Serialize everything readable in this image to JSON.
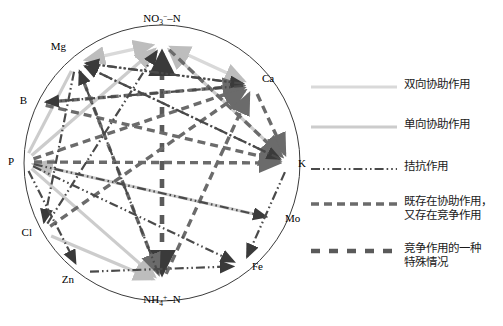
{
  "figure": {
    "type": "network-diagram",
    "title": "",
    "shape": "circle",
    "background": "#ffffff"
  },
  "nodes": [
    {
      "id": "NO3N",
      "label": "NO",
      "sup": "−",
      "sub": "3",
      "tail": "–N",
      "display": "NO3−–N",
      "x": 162,
      "y": 43,
      "lx": 162,
      "ly": 22,
      "anchor": "middle"
    },
    {
      "id": "Mg",
      "label": "Mg",
      "display": "Mg",
      "x": 76,
      "y": 62,
      "lx": 66,
      "ly": 50,
      "anchor": "end"
    },
    {
      "id": "B",
      "label": "B",
      "display": "B",
      "x": 36,
      "y": 103,
      "lx": 27,
      "ly": 104,
      "anchor": "end"
    },
    {
      "id": "P",
      "label": "P",
      "display": "P",
      "x": 24,
      "y": 162,
      "lx": 14,
      "ly": 165,
      "anchor": "end"
    },
    {
      "id": "Cl",
      "label": "Cl",
      "display": "Cl",
      "x": 42,
      "y": 232,
      "lx": 32,
      "ly": 236,
      "anchor": "end"
    },
    {
      "id": "Zn",
      "label": "Zn",
      "display": "Zn",
      "x": 80,
      "y": 272,
      "lx": 74,
      "ly": 283,
      "anchor": "end"
    },
    {
      "id": "NH4N",
      "label": "NH",
      "sup": "+",
      "sub": "4",
      "tail": "–N",
      "display": "NH4+–N",
      "x": 162,
      "y": 283,
      "lx": 162,
      "ly": 303,
      "anchor": "middle"
    },
    {
      "id": "Fe",
      "label": "Fe",
      "display": "Fe",
      "x": 243,
      "y": 266,
      "lx": 252,
      "ly": 270,
      "anchor": "start"
    },
    {
      "id": "Mo",
      "label": "Mo",
      "display": "Mo",
      "x": 276,
      "y": 219,
      "lx": 285,
      "ly": 222,
      "anchor": "start"
    },
    {
      "id": "K",
      "label": "K",
      "display": "K",
      "x": 289,
      "y": 163,
      "lx": 298,
      "ly": 167,
      "anchor": "start"
    },
    {
      "id": "Ca",
      "label": "Ca",
      "display": "Ca",
      "x": 253,
      "y": 85,
      "lx": 262,
      "ly": 82,
      "anchor": "start"
    }
  ],
  "circle": {
    "cx": 162,
    "cy": 163,
    "r": 138,
    "stroke": "#3b3b3b",
    "stroke_width": 1
  },
  "edge_styles": {
    "bidir_synergy": {
      "color": "#d9d9d9",
      "width": 3.2,
      "dash": "none"
    },
    "unidir_synergy": {
      "color": "#cccccc",
      "width": 3.2,
      "dash": "none"
    },
    "antagonism": {
      "color": "#4a4a4a",
      "width": 2.2,
      "dash": "9,3,1.6,3,1.6,3"
    },
    "both": {
      "color": "#6b6b6b",
      "width": 3.4,
      "dash": "8,5"
    },
    "special": {
      "color": "#5a5a5a",
      "width": 4.6,
      "dash": "9,9"
    }
  },
  "edges": [
    {
      "from": "Mg",
      "to": "NO3N",
      "style": "bidir_synergy",
      "arrow": "both"
    },
    {
      "from": "Ca",
      "to": "NO3N",
      "style": "bidir_synergy",
      "arrow": "both"
    },
    {
      "from": "Mg",
      "to": "P",
      "style": "unidir_synergy",
      "arrow": "none"
    },
    {
      "from": "P",
      "to": "NO3N",
      "style": "unidir_synergy",
      "arrow": "to"
    },
    {
      "from": "K",
      "to": "NO3N",
      "style": "unidir_synergy",
      "arrow": "to"
    },
    {
      "from": "Mo",
      "to": "P",
      "style": "unidir_synergy",
      "arrow": "to"
    },
    {
      "from": "Cl",
      "to": "NH4N",
      "style": "unidir_synergy",
      "arrow": "to"
    },
    {
      "from": "P",
      "to": "NH4N",
      "style": "unidir_synergy",
      "arrow": "to"
    },
    {
      "from": "NO3N",
      "to": "NH4N",
      "style": "special",
      "arrow": "both"
    },
    {
      "from": "B",
      "to": "K",
      "style": "both",
      "arrow": "to"
    },
    {
      "from": "B",
      "to": "Ca",
      "style": "both",
      "arrow": "to"
    },
    {
      "from": "P",
      "to": "Ca",
      "style": "both",
      "arrow": "to"
    },
    {
      "from": "P",
      "to": "K",
      "style": "both",
      "arrow": "to"
    },
    {
      "from": "Ca",
      "to": "K",
      "style": "both",
      "arrow": "to"
    },
    {
      "from": "NO3N",
      "to": "K",
      "style": "both",
      "arrow": "to"
    },
    {
      "from": "Cl",
      "to": "Ca",
      "style": "both",
      "arrow": "to"
    },
    {
      "from": "NH4N",
      "to": "Ca",
      "style": "both",
      "arrow": "to"
    },
    {
      "from": "Mg",
      "to": "NH4N",
      "style": "both",
      "arrow": "to"
    },
    {
      "from": "Mg",
      "to": "Ca",
      "style": "antagonism",
      "arrow": "to"
    },
    {
      "from": "Mg",
      "to": "K",
      "style": "antagonism",
      "arrow": "to"
    },
    {
      "from": "Mg",
      "to": "Cl",
      "style": "antagonism",
      "arrow": "to"
    },
    {
      "from": "P",
      "to": "Zn",
      "style": "antagonism",
      "arrow": "to"
    },
    {
      "from": "P",
      "to": "Fe",
      "style": "antagonism",
      "arrow": "to"
    },
    {
      "from": "P",
      "to": "Mo",
      "style": "antagonism",
      "arrow": "to"
    },
    {
      "from": "Zn",
      "to": "Fe",
      "style": "antagonism",
      "arrow": "to"
    },
    {
      "from": "K",
      "to": "Mg",
      "style": "antagonism",
      "arrow": "to"
    },
    {
      "from": "Ca",
      "to": "Mg",
      "style": "antagonism",
      "arrow": "to"
    },
    {
      "from": "K",
      "to": "Fe",
      "style": "antagonism",
      "arrow": "to"
    },
    {
      "from": "Ca",
      "to": "B",
      "style": "antagonism",
      "arrow": "to"
    },
    {
      "from": "NH4N",
      "to": "Mg",
      "style": "antagonism",
      "arrow": "to"
    },
    {
      "from": "Cl",
      "to": "NO3N",
      "style": "antagonism",
      "arrow": "to"
    },
    {
      "from": "Fe",
      "to": "Mn",
      "style": "antagonism",
      "arrow": "to"
    }
  ],
  "legend": {
    "items": [
      {
        "id": "bidir-synergy",
        "style": "bidir_synergy",
        "label": "双向协助作用",
        "y": 18
      },
      {
        "id": "unidir-synergy",
        "style": "unidir_synergy",
        "label": "单向协助作用",
        "y": 58
      },
      {
        "id": "antagonism",
        "style": "antagonism",
        "label": "拮抗作用",
        "y": 100
      },
      {
        "id": "both-effects",
        "style": "both",
        "label": "既存在协助作用，\n又存在竞争作用",
        "y": 135
      },
      {
        "id": "special-case",
        "style": "special",
        "label": "竞争作用的一种\n特殊情况",
        "y": 182
      }
    ]
  }
}
